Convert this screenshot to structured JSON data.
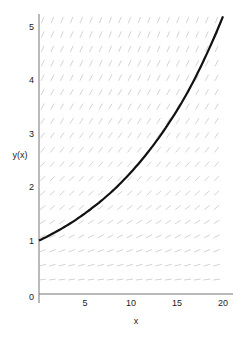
{
  "chart_data": {
    "type": "line",
    "title": "",
    "xlabel": "x",
    "ylabel": "y(x)",
    "xlim": [
      0,
      20.5
    ],
    "ylim": [
      0,
      5.25
    ],
    "x_ticks": [
      0,
      5,
      10,
      15,
      20
    ],
    "x_tick_labels": [
      "",
      "5",
      "10",
      "15",
      "20"
    ],
    "y_ticks": [
      0,
      1,
      2,
      3,
      4,
      5
    ],
    "y_tick_labels": [
      "0",
      "1",
      "2",
      "3",
      "4",
      "5"
    ],
    "grid": false,
    "legend": null,
    "slope_field": {
      "k": 0.0824,
      "x_step": 1.05,
      "y_step": 0.27,
      "color": "#c8c8c8"
    },
    "series": [
      {
        "name": "y(x)",
        "color": "#111111",
        "x": [
          0,
          2,
          4,
          6,
          8,
          10,
          12,
          14,
          16,
          18,
          20
        ],
        "y": [
          1.0,
          1.18,
          1.39,
          1.64,
          1.93,
          2.28,
          2.69,
          3.17,
          3.73,
          4.41,
          5.2
        ]
      }
    ]
  },
  "labels": {
    "x_axis": "x",
    "y_axis": "y(x)",
    "origin": "0"
  }
}
